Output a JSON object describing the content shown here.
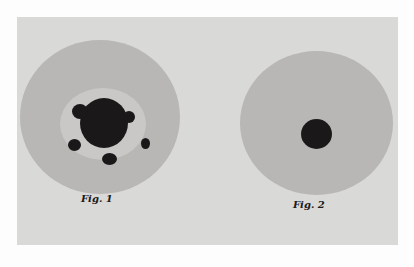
{
  "figures": [
    {
      "caption": "Fig. 1",
      "description": "culture plate with large irregular dark colony and satellite colonies"
    },
    {
      "caption": "Fig. 2",
      "description": "culture plate with single small round dark colony in center"
    }
  ]
}
